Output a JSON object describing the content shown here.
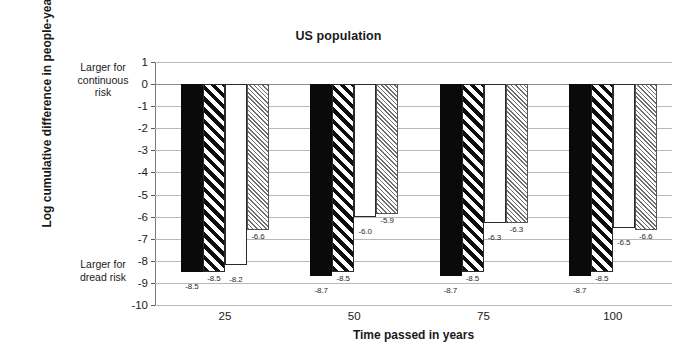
{
  "chart_data": {
    "type": "bar",
    "title": "US population",
    "xlabel": "Time passed in years",
    "ylabel": "Log cumulative difference in people-years",
    "categories": [
      "25",
      "50",
      "75",
      "100"
    ],
    "series": [
      {
        "name": "series-1",
        "pattern": "solid-black",
        "values": [
          -8.5,
          -8.7,
          -8.7,
          -8.7
        ]
      },
      {
        "name": "series-2",
        "pattern": "bold-diagonal-stripe",
        "values": [
          -8.5,
          -8.5,
          -8.5,
          -8.5
        ]
      },
      {
        "name": "series-3",
        "pattern": "plain-white",
        "values": [
          -8.2,
          -6.0,
          -6.3,
          -6.5
        ]
      },
      {
        "name": "series-4",
        "pattern": "fine-gray-hatch",
        "values": [
          -6.6,
          -5.9,
          -6.3,
          -6.6
        ]
      }
    ],
    "ylim": [
      -10,
      1
    ],
    "yticks": [
      "1",
      "0",
      "-1",
      "-2",
      "-3",
      "-4",
      "-5",
      "-6",
      "-7",
      "-8",
      "-9",
      "-10"
    ],
    "ytick_values": [
      1,
      0,
      -1,
      -2,
      -3,
      -4,
      -5,
      -6,
      -7,
      -8,
      -9,
      -10
    ],
    "grid": true,
    "legend": "none",
    "annotations": {
      "top": "Larger for continuous risk",
      "bottom": "Larger for dread risk"
    },
    "value_labels": [
      "-8.5",
      "-8.5",
      "-8.2",
      "-6.6",
      "-8.7",
      "-8.5",
      "-6.0",
      "-5.9",
      "-8.7",
      "-8.5",
      "-6.3",
      "-6.3",
      "-8.7",
      "-8.5",
      "-6.5",
      "-6.6"
    ],
    "colors": {
      "bar_solid": "#0a0a0a",
      "bar_stripe_line": "#0d0d0d",
      "bar_white": "#ffffff",
      "bar_hatch_line": "#6e6e6e",
      "gridline": "#b8b8b8",
      "axis": "#7a7a7a",
      "text": "#1a1a1a",
      "background": "#ffffff"
    }
  },
  "axis_annotations": {
    "top_line1": "Larger for",
    "top_line2": "continuous",
    "top_line3": "risk",
    "bottom_line1": "Larger for",
    "bottom_line2": "dread risk"
  }
}
